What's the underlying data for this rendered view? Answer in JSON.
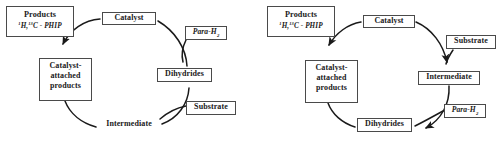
{
  "figure": {
    "background_color": "#ffffff",
    "line_color": "#1a1a1a",
    "box_border_color": "#4a4a4a",
    "text_color": "#1a1a1a"
  },
  "panels": [
    {
      "id": "left",
      "name": "phip-catalytic-cycle-parahydrogen-first",
      "nodes": {
        "products_title": "Products",
        "products_formula_pre": "",
        "products_iso1_sup": "1",
        "products_iso1": "H,",
        "products_iso2_sup": "13",
        "products_iso2": "C - PHIP",
        "catalyst": "Catalyst",
        "parah2_text": "Para-H",
        "parah2_sub": "2",
        "dihydrides": "Dihydrides",
        "substrate": "Substrate",
        "catalyst_attached": "Catalyst-attached products",
        "catalyst_attached_lines": [
          "Catalyst-",
          "attached",
          "products"
        ],
        "intermediate": "Intermediate"
      }
    },
    {
      "id": "right",
      "name": "phip-catalytic-cycle-substrate-first",
      "nodes": {
        "products_title": "Products",
        "products_iso1_sup": "1",
        "products_iso1": "H,",
        "products_iso2_sup": "13",
        "products_iso2": "C - PHIP",
        "catalyst": "Catalyst",
        "substrate": "Substrate",
        "intermediate": "Intermediate",
        "parah2_text": "Para-H",
        "parah2_sub": "2",
        "dihydrides": "Dihydrides",
        "catalyst_attached": "Catalyst-attached products",
        "catalyst_attached_lines": [
          "Catalyst-",
          "attached",
          "products"
        ]
      }
    }
  ],
  "diagram_data": {
    "type": "cycle-diagram",
    "description": "Two parahydrogen induced polarization (PHIP) catalytic cycle schemes shown side by side.",
    "left_cycle_order": [
      "Catalyst",
      "Dihydrides",
      "Intermediate",
      "Catalyst-attached products",
      "Products"
    ],
    "left_inputs": {
      "Dihydrides": "Para-H2",
      "Intermediate": "Substrate"
    },
    "right_cycle_order": [
      "Catalyst",
      "Intermediate",
      "Dihydrides",
      "Catalyst-attached products",
      "Products"
    ],
    "right_inputs": {
      "Intermediate": "Substrate",
      "Dihydrides": "Para-H2"
    },
    "output": "1H,13C - PHIP Products"
  }
}
